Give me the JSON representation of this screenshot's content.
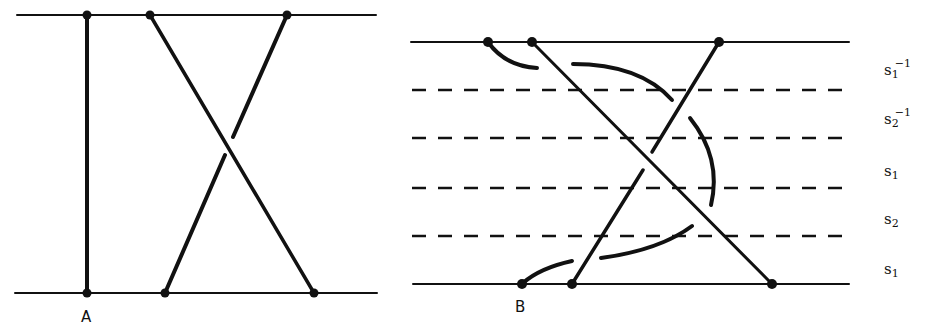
{
  "panels": [
    {
      "label": "A",
      "description": "simple crossing of two strands between two horizontal lines"
    },
    {
      "label": "B",
      "description": "crossing decomposed into braid generators across dashed levels"
    }
  ],
  "generators": [
    {
      "base": "s",
      "sub": "1",
      "sup": "−1"
    },
    {
      "base": "s",
      "sub": "2",
      "sup": "−1"
    },
    {
      "base": "s",
      "sub": "1",
      "sup": ""
    },
    {
      "base": "s",
      "sub": "2",
      "sup": ""
    },
    {
      "base": "s",
      "sub": "1",
      "sup": ""
    }
  ],
  "colors": {
    "ink": "#111111",
    "background": "#ffffff"
  }
}
